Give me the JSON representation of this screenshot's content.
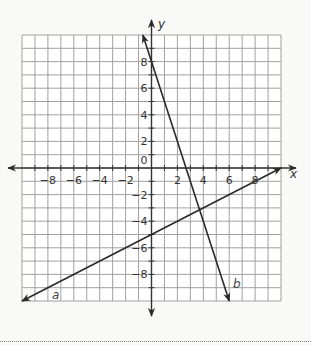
{
  "chart_data": {
    "type": "line",
    "title": "",
    "xlabel": "x",
    "ylabel": "y",
    "xlim": [
      -10,
      10
    ],
    "ylim": [
      -10,
      10
    ],
    "grid": true,
    "grid_step": 1,
    "x_ticks": [
      -8,
      -6,
      -4,
      -2,
      2,
      4,
      6,
      8
    ],
    "y_ticks": [
      8,
      6,
      4,
      2,
      -2,
      -4,
      -6,
      -8
    ],
    "origin_label": "0",
    "series": [
      {
        "name": "a",
        "equation": "y = 0.5x - 5",
        "slope": 0.5,
        "intercept": -5,
        "x": [
          -10,
          10
        ],
        "y": [
          -10,
          0
        ],
        "arrows": "both"
      },
      {
        "name": "b",
        "equation": "y = -3x + 8",
        "slope": -3,
        "intercept": 8,
        "x": [
          -0.667,
          6
        ],
        "y": [
          10,
          -10
        ],
        "arrows": "both"
      }
    ],
    "intersection": {
      "x": 3.71,
      "y": -3.14
    },
    "legend": "none (lines labeled inline: a, b)"
  },
  "colors": {
    "background": "#f9f9f8",
    "grid": "#a0a0a0",
    "axis": "#333333",
    "line": "#2a2a2a"
  },
  "labels": {
    "x_axis": "x",
    "y_axis": "y",
    "line_a": "a",
    "line_b": "b"
  }
}
